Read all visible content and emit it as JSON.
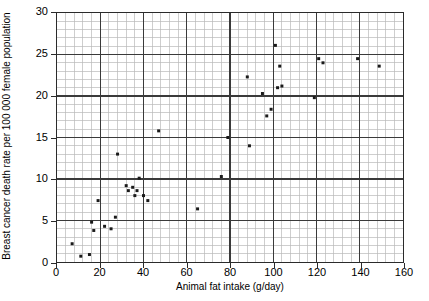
{
  "chart_data": {
    "type": "scatter",
    "title": "",
    "xlabel": "Animal fat intake (g/day)",
    "ylabel": "Breast cancer death rate per 100 000 female population",
    "xlim": [
      0,
      160
    ],
    "ylim": [
      0,
      30
    ],
    "xticks": [
      0,
      20,
      40,
      60,
      80,
      100,
      120,
      140,
      160
    ],
    "yticks": [
      0,
      5,
      10,
      15,
      20,
      25,
      30
    ],
    "x_major_step": 20,
    "x_minor_step": 4,
    "y_major_step": 5,
    "y_minor_step": 1,
    "grid": true,
    "legend": null,
    "marker": "small-filled-square",
    "marker_color": "#1a1a1a",
    "points": [
      {
        "x": 7,
        "y": 2.2
      },
      {
        "x": 11,
        "y": 0.7
      },
      {
        "x": 15,
        "y": 0.9
      },
      {
        "x": 16,
        "y": 4.8
      },
      {
        "x": 17,
        "y": 3.8
      },
      {
        "x": 19,
        "y": 7.4
      },
      {
        "x": 22,
        "y": 4.3
      },
      {
        "x": 25,
        "y": 4.0
      },
      {
        "x": 27,
        "y": 5.4
      },
      {
        "x": 28,
        "y": 13.0
      },
      {
        "x": 32,
        "y": 9.2
      },
      {
        "x": 33,
        "y": 8.6
      },
      {
        "x": 35,
        "y": 9.0
      },
      {
        "x": 36,
        "y": 8.0
      },
      {
        "x": 37,
        "y": 8.6
      },
      {
        "x": 38,
        "y": 10.1
      },
      {
        "x": 40,
        "y": 8.0
      },
      {
        "x": 42,
        "y": 7.4
      },
      {
        "x": 47,
        "y": 15.8
      },
      {
        "x": 65,
        "y": 6.4
      },
      {
        "x": 76,
        "y": 10.3
      },
      {
        "x": 79,
        "y": 15.0
      },
      {
        "x": 88,
        "y": 22.3
      },
      {
        "x": 89,
        "y": 14.0
      },
      {
        "x": 95,
        "y": 20.3
      },
      {
        "x": 97,
        "y": 17.6
      },
      {
        "x": 99,
        "y": 18.4
      },
      {
        "x": 101,
        "y": 26.1
      },
      {
        "x": 102,
        "y": 21.0
      },
      {
        "x": 103,
        "y": 23.6
      },
      {
        "x": 104,
        "y": 21.2
      },
      {
        "x": 119,
        "y": 19.8
      },
      {
        "x": 121,
        "y": 24.5
      },
      {
        "x": 123,
        "y": 24.0
      },
      {
        "x": 139,
        "y": 24.5
      },
      {
        "x": 149,
        "y": 23.6
      }
    ]
  }
}
